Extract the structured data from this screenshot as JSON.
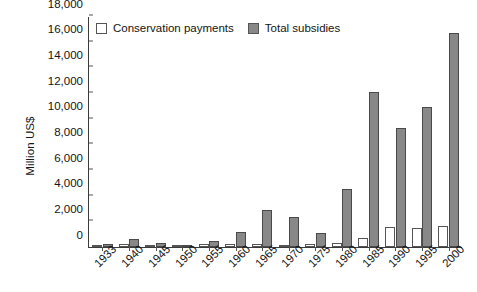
{
  "chart_data": {
    "type": "bar",
    "title": "",
    "xlabel": "",
    "ylabel": "Million US$",
    "ylim": [
      0,
      18000
    ],
    "ytick_values": [
      0,
      2000,
      4000,
      6000,
      8000,
      10000,
      12000,
      14000,
      16000,
      18000
    ],
    "ytick_labels": [
      "0",
      "2,000",
      "4,000",
      "6,000",
      "8,000",
      "10,000",
      "12,000",
      "14,000",
      "16,000",
      "18,000"
    ],
    "grid": false,
    "legend_position": "top-left",
    "categories": [
      "1933",
      "1940",
      "1945",
      "1950",
      "1955",
      "1960",
      "1965",
      "1970",
      "1975",
      "1980",
      "1985",
      "1990",
      "1995",
      "2000"
    ],
    "series": [
      {
        "name": "Conservation payments",
        "color": "#ffffff",
        "values": [
          60,
          230,
          180,
          60,
          200,
          230,
          270,
          170,
          230,
          280,
          700,
          1550,
          1500,
          1650
        ]
      },
      {
        "name": "Total subsidies",
        "color": "#888888",
        "values": [
          260,
          600,
          330,
          120,
          450,
          1150,
          2900,
          2350,
          1100,
          4500,
          12100,
          9250,
          10900,
          16700
        ]
      }
    ]
  },
  "legend": {
    "items": [
      {
        "label": "Conservation payments",
        "swatch": "white-square-icon"
      },
      {
        "label": "Total subsidies",
        "swatch": "gray-square-icon"
      }
    ]
  }
}
